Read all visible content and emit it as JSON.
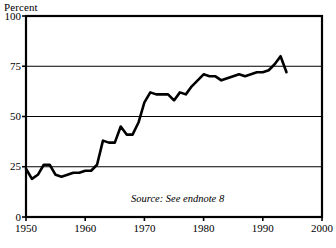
{
  "chart_data": {
    "type": "line",
    "title": "",
    "subtitle": "",
    "xlabel": "",
    "ylabel": "Percent",
    "xlim": [
      1950,
      2000
    ],
    "ylim": [
      0,
      100
    ],
    "grid": true,
    "legend": null,
    "xticks": [
      "1950",
      "1960",
      "1970",
      "1980",
      "1990",
      "2000"
    ],
    "xtick_values": [
      1950,
      1960,
      1970,
      1980,
      1990,
      2000
    ],
    "yticks": [
      "0",
      "25",
      "50",
      "75",
      "100"
    ],
    "ytick_values": [
      0,
      25,
      50,
      75,
      100
    ],
    "annotations": [
      {
        "text": "Source: See endnote 8",
        "style": "italic",
        "x": 1988,
        "y": 9
      }
    ],
    "series": [
      {
        "name": "percent",
        "color": "#000000",
        "line_width": 2.6,
        "x": [
          1950,
          1951,
          1952,
          1953,
          1954,
          1955,
          1956,
          1957,
          1958,
          1959,
          1960,
          1961,
          1962,
          1963,
          1964,
          1965,
          1966,
          1967,
          1968,
          1969,
          1970,
          1971,
          1972,
          1973,
          1974,
          1975,
          1976,
          1977,
          1978,
          1979,
          1980,
          1981,
          1982,
          1983,
          1984,
          1985,
          1986,
          1987,
          1988,
          1989,
          1990,
          1991,
          1992,
          1993,
          1994
        ],
        "values": [
          24,
          19,
          21,
          26,
          26,
          21,
          20,
          21,
          22,
          22,
          23,
          23,
          26,
          38,
          37,
          37,
          45,
          41,
          41,
          47,
          57,
          62,
          61,
          61,
          61,
          58,
          62,
          61,
          65,
          68,
          71,
          70,
          70,
          68,
          69,
          70,
          71,
          70,
          71,
          72,
          72,
          73,
          76,
          80,
          72
        ]
      }
    ]
  }
}
